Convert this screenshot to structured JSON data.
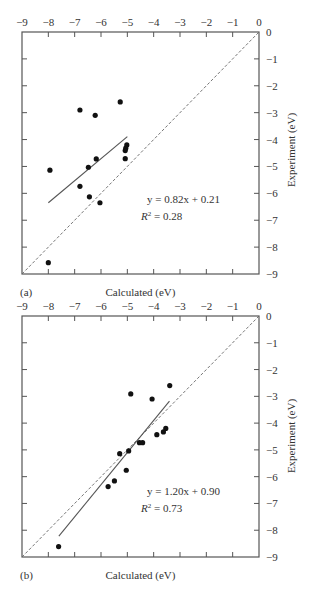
{
  "chart_data": [
    {
      "type": "scatter",
      "panel_label": "(a)",
      "xlabel": "Calculated (eV)",
      "ylabel": "Experiment (eV)",
      "xlim": [
        -9,
        0
      ],
      "ylim": [
        -9,
        0
      ],
      "x_ticks": [
        -9,
        -8,
        -7,
        -6,
        -5,
        -4,
        -3,
        -2,
        -1,
        0
      ],
      "x_tick_labels": [
        "−9",
        "−8",
        "−7",
        "−6",
        "−5",
        "−4",
        "−3",
        "−2",
        "−1",
        "0"
      ],
      "y_ticks": [
        0,
        -1,
        -2,
        -3,
        -4,
        -5,
        -6,
        -7,
        -8,
        -9
      ],
      "y_tick_labels": [
        "0",
        "−1",
        "−2",
        "−3",
        "−4",
        "−5",
        "−6",
        "−7",
        "−8",
        "−9"
      ],
      "x_axis_position": "top",
      "y_axis_position": "right",
      "grid": false,
      "points": {
        "x": [
          -6.8,
          -6.22,
          -5.27,
          -5.02,
          -5.06,
          -5.08,
          -5.08,
          -6.18,
          -6.48,
          -7.94,
          -6.8,
          -6.44,
          -6.04,
          -8.0
        ],
        "y": [
          -2.9,
          -3.1,
          -2.6,
          -4.2,
          -4.32,
          -4.41,
          -4.71,
          -4.72,
          -5.03,
          -5.14,
          -5.74,
          -6.13,
          -6.35,
          -8.58
        ]
      },
      "fit": {
        "slope": 0.82,
        "intercept": 0.21,
        "x_range": [
          -8.0,
          -5.0
        ]
      },
      "identity_line": {
        "style": "dashed",
        "x_range": [
          -9,
          0
        ]
      },
      "annotation": {
        "equation": "y = 0.82x + 0.21",
        "r2_label": "R",
        "r2_sup": "2",
        "r2_value": " = 0.28"
      }
    },
    {
      "type": "scatter",
      "panel_label": "(b)",
      "xlabel": "Calculated (eV)",
      "ylabel": "Experiment (eV)",
      "xlim": [
        -9,
        0
      ],
      "ylim": [
        -9,
        0
      ],
      "x_ticks": [
        -9,
        -8,
        -7,
        -6,
        -5,
        -4,
        -3,
        -2,
        -1,
        0
      ],
      "x_tick_labels": [
        "−9",
        "−8",
        "−7",
        "−6",
        "−5",
        "−4",
        "−3",
        "−2",
        "−1",
        "0"
      ],
      "y_ticks": [
        0,
        -1,
        -2,
        -3,
        -4,
        -5,
        -6,
        -7,
        -8,
        -9
      ],
      "y_tick_labels": [
        "0",
        "−1",
        "−2",
        "−3",
        "−4",
        "−5",
        "−6",
        "−7",
        "−8",
        "−9"
      ],
      "x_axis_position": "top",
      "y_axis_position": "right",
      "grid": false,
      "points": {
        "x": [
          -4.87,
          -4.06,
          -3.39,
          -3.54,
          -3.63,
          -3.88,
          -4.54,
          -4.42,
          -4.95,
          -5.29,
          -5.04,
          -5.49,
          -5.73,
          -7.61
        ],
        "y": [
          -2.91,
          -3.1,
          -2.6,
          -4.2,
          -4.33,
          -4.43,
          -4.73,
          -4.73,
          -5.04,
          -5.14,
          -5.76,
          -6.16,
          -6.37,
          -8.61
        ]
      },
      "fit": {
        "slope": 1.2,
        "intercept": 0.9,
        "x_range": [
          -7.6,
          -3.4
        ]
      },
      "identity_line": {
        "style": "dashed",
        "x_range": [
          -9,
          0
        ]
      },
      "annotation": {
        "equation": "y = 1.20x + 0.90",
        "r2_label": "R",
        "r2_sup": "2",
        "r2_value": " = 0.73"
      }
    }
  ]
}
